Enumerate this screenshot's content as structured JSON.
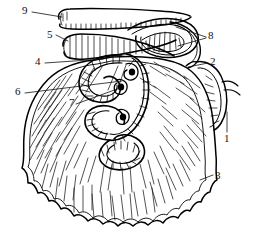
{
  "figure": {
    "style": "black ink line engraving, hatched shading",
    "ink_color": "#000000",
    "background_color": "#ffffff",
    "width": 254,
    "height": 238
  },
  "labels": [
    {
      "id": "1",
      "text": "1",
      "x": 225,
      "y": 134,
      "leader": "vertical line upward to right-hand appendage"
    },
    {
      "id": "2",
      "text": "2",
      "x": 210,
      "y": 60,
      "leader": "line leftward to right margin of omentum"
    },
    {
      "id": "3",
      "text": "3",
      "x": 215,
      "y": 172,
      "leader": "short line to scalloped lower-right border"
    },
    {
      "id": "4",
      "text": "4",
      "x": 35,
      "y": 61,
      "leader": "long line rightward to upper omentum edge"
    },
    {
      "id": "5",
      "text": "5",
      "x": 47,
      "y": 32,
      "leader": "short line to transverse colon"
    },
    {
      "id": "6",
      "text": "6",
      "x": 15,
      "y": 91,
      "leader": "long line rightward to intestinal coil"
    },
    {
      "id": "7",
      "text": "7",
      "x": 69,
      "y": 102,
      "leader": "line rightward to inner coil loop"
    },
    {
      "id": "8",
      "text": "8",
      "x": 208,
      "y": 34,
      "leader": "forked pair of lines leftward to mesenteric loops"
    },
    {
      "id": "9",
      "text": "9",
      "x": 22,
      "y": 7,
      "leader": "line rightward to blind tube end"
    }
  ]
}
